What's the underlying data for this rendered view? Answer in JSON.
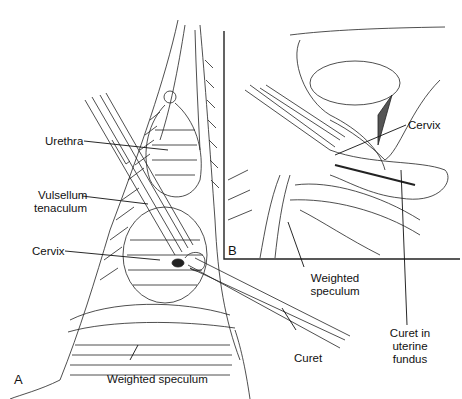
{
  "figure": {
    "panels": [
      {
        "id": "A",
        "label": "A"
      },
      {
        "id": "B",
        "label": "B"
      }
    ],
    "labels_a": {
      "urethra": "Urethra",
      "vulsellum_1": "Vulsellum",
      "vulsellum_2": "tenaculum",
      "cervix": "Cervix",
      "curet": "Curet",
      "weighted_speculum": "Weighted speculum"
    },
    "labels_b": {
      "cervix": "Cervix",
      "weighted_1": "Weighted",
      "weighted_2": "speculum",
      "curet_1": "Curet in",
      "curet_2": "uterine",
      "curet_3": "fundus"
    },
    "colors": {
      "ink": "#111111",
      "background": "#ffffff"
    }
  }
}
